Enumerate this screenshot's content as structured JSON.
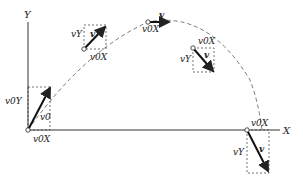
{
  "axes": {
    "x_label": "X",
    "y_label": "Y"
  },
  "points": [
    {
      "name": "launch",
      "vx_label": "v0X",
      "vy_label": "v0Y",
      "v_label": "v0"
    },
    {
      "name": "rising",
      "vx_label": "v0X",
      "vy_label": "vY",
      "v_label": "v"
    },
    {
      "name": "apex",
      "vx_label": "v0X",
      "v_label": "v"
    },
    {
      "name": "falling",
      "vx_label": "v0X",
      "vy_label": "vY",
      "v_label": "v"
    },
    {
      "name": "landing",
      "vx_label": "v0X",
      "vy_label": "vY",
      "v_label": "v"
    }
  ],
  "colors": {
    "line": "#222222",
    "background": "#ffffff"
  }
}
